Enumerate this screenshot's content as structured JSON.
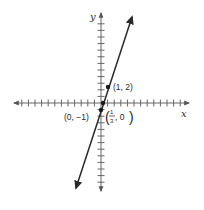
{
  "chart_data": {
    "type": "line",
    "title": "",
    "xlabel": "x",
    "ylabel": "y",
    "xlim": [
      -13,
      13
    ],
    "ylim": [
      -13,
      13
    ],
    "grid": false,
    "axis_ticks_every": 1,
    "series": [
      {
        "name": "y = 3x - 1",
        "slope": 3,
        "intercept": -1,
        "color": "#2a2a2a",
        "arrows_both_ends": true
      }
    ],
    "points": [
      {
        "x": 1,
        "y": 2,
        "label": "(1, 2)"
      },
      {
        "x": 0.3333,
        "y": 0,
        "label": "(1/3, 0)",
        "label_num": "1",
        "label_den": "3",
        "label_rest": ", 0"
      },
      {
        "x": 0,
        "y": -1,
        "label": "(0, −1)"
      }
    ]
  },
  "labels": {
    "x_axis": "x",
    "y_axis": "y",
    "point_1_2": "(1, 2)",
    "point_0_m1": "(0, −1)",
    "frac_num": "1",
    "frac_den": "3",
    "frac_rest": ", 0"
  },
  "colors": {
    "ink": "#2a2a2a",
    "axis": "#555555",
    "background": "#ffffff"
  }
}
